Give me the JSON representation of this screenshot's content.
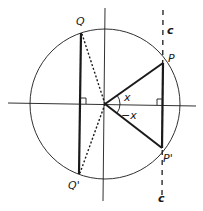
{
  "figure": {
    "labels": {
      "Q": "Q",
      "Q_prime": "Q'",
      "P": "P",
      "P_prime": "P'",
      "c_top": "c",
      "c_bottom": "c",
      "angle_x": "x",
      "angle_neg_x": "−x"
    },
    "colors": {
      "stroke": "#1a1a1a",
      "background": "#ffffff"
    }
  }
}
